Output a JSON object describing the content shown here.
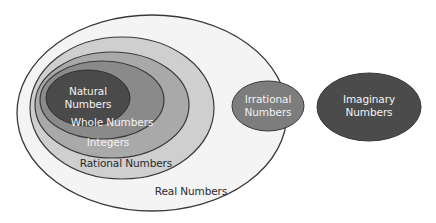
{
  "diagram": {
    "sets": {
      "real": {
        "label": "Real Numbers",
        "fill": "#f4f4f4",
        "stroke": "#3a3a3a"
      },
      "rational": {
        "label": "Rational Numbers",
        "fill": "#cfcfcf",
        "stroke": "#3a3a3a"
      },
      "integers": {
        "label": "Integers",
        "fill": "#a9a9a9",
        "stroke": "#3a3a3a"
      },
      "whole": {
        "label": "Whole Numbers",
        "fill": "#8a8a8a",
        "stroke": "#3a3a3a"
      },
      "natural": {
        "label_line1": "Natural",
        "label_line2": "Numbers",
        "fill": "#4a4a4a",
        "stroke": "#2f2f2f"
      },
      "irrational": {
        "label_line1": "Irrational",
        "label_line2": "Numbers",
        "fill": "#7d7d7d",
        "stroke": "#3a3a3a"
      },
      "imaginary": {
        "label_line1": "Imaginary",
        "label_line2": "Numbers",
        "fill": "#4b4b4b",
        "stroke": "#3a3a3a"
      }
    },
    "relations": [
      "Natural ⊂ Whole ⊂ Integers ⊂ Rational ⊂ Real",
      "Irrational ⊂ Real",
      "Imaginary outside Real"
    ]
  }
}
